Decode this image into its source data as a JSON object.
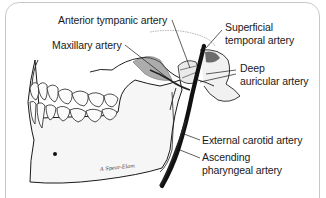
{
  "figure": {
    "labels": [
      {
        "id": "anterior-tympanic",
        "text": "Anterior tympanic artery",
        "x": 58,
        "y": 15
      },
      {
        "id": "maxillary",
        "text": "Maxillary artery",
        "x": 52,
        "y": 40
      },
      {
        "id": "superficial-temporal-1",
        "text": "Superficial",
        "x": 225,
        "y": 22
      },
      {
        "id": "superficial-temporal-2",
        "text": "temporal artery",
        "x": 225,
        "y": 35
      },
      {
        "id": "deep-auricular-1",
        "text": "Deep",
        "x": 240,
        "y": 63
      },
      {
        "id": "deep-auricular-2",
        "text": "auricular artery",
        "x": 240,
        "y": 76
      },
      {
        "id": "external-carotid",
        "text": "External carotid artery",
        "x": 202,
        "y": 135
      },
      {
        "id": "ascending-pharyngeal-1",
        "text": "Ascending",
        "x": 202,
        "y": 152
      },
      {
        "id": "ascending-pharyngeal-2",
        "text": "pharyngeal artery",
        "x": 202,
        "y": 165
      }
    ],
    "signature": "A Spear-Elam",
    "colors": {
      "ink": "#1a1a1a",
      "bone_fill": "#f4f4f4",
      "shade": "#555555",
      "frame": "#c8c8c8"
    }
  }
}
